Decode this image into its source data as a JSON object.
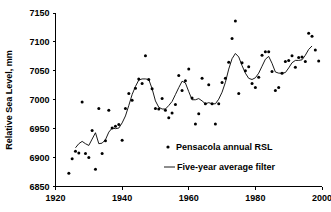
{
  "chart_data": {
    "type": "scatter",
    "title": "",
    "xlabel": "",
    "ylabel": "Relative Sea Level, mm",
    "xlim": [
      1920,
      2000
    ],
    "ylim": [
      6850,
      7150
    ],
    "xticks": [
      1920,
      1940,
      1960,
      1980,
      2000
    ],
    "yticks": [
      6850,
      6900,
      6950,
      7000,
      7050,
      7100,
      7150
    ],
    "grid": false,
    "legend_position": "center-right-inside",
    "series": [
      {
        "name": "Pensacola annual RSL",
        "marker": "dot",
        "color": "#000000",
        "x": [
          1924,
          1925,
          1926,
          1927,
          1928,
          1929,
          1930,
          1931,
          1932,
          1933,
          1934,
          1935,
          1936,
          1937,
          1938,
          1939,
          1940,
          1941,
          1942,
          1943,
          1944,
          1945,
          1946,
          1947,
          1948,
          1949,
          1950,
          1951,
          1952,
          1953,
          1954,
          1955,
          1956,
          1957,
          1958,
          1959,
          1960,
          1961,
          1962,
          1963,
          1964,
          1965,
          1966,
          1967,
          1968,
          1969,
          1970,
          1971,
          1972,
          1973,
          1974,
          1975,
          1976,
          1977,
          1978,
          1979,
          1980,
          1981,
          1982,
          1983,
          1984,
          1985,
          1986,
          1987,
          1988,
          1989,
          1990,
          1991,
          1992,
          1993,
          1994,
          1995,
          1996,
          1997,
          1998,
          1999
        ],
        "y": [
          6873,
          6898,
          6911,
          6908,
          6996,
          6907,
          6900,
          6947,
          6880,
          6985,
          6907,
          6929,
          6982,
          6951,
          6954,
          6957,
          6930,
          6985,
          7011,
          6999,
          7020,
          7036,
          7028,
          7076,
          7035,
          7019,
          6985,
          6984,
          7002,
          6982,
          6969,
          6977,
          6992,
          7042,
          7016,
          7033,
          7053,
          7003,
          6958,
          6976,
          7037,
          6993,
          7026,
          6993,
          6958,
          6993,
          7030,
          7037,
          7065,
          7106,
          7136,
          7011,
          7064,
          7050,
          7057,
          7028,
          7021,
          7039,
          7077,
          7083,
          7083,
          7049,
          7016,
          7021,
          7046,
          7066,
          7068,
          7076,
          7056,
          7073,
          7074,
          7066,
          7115,
          7110,
          7086,
          7067
        ]
      },
      {
        "name": "Five-year average filter",
        "marker": "line",
        "color": "#000000",
        "x": [
          1926,
          1927,
          1928,
          1929,
          1930,
          1931,
          1932,
          1933,
          1934,
          1935,
          1936,
          1937,
          1938,
          1939,
          1940,
          1941,
          1942,
          1943,
          1944,
          1945,
          1946,
          1947,
          1948,
          1949,
          1950,
          1951,
          1952,
          1953,
          1954,
          1955,
          1956,
          1957,
          1958,
          1959,
          1960,
          1961,
          1962,
          1963,
          1964,
          1965,
          1966,
          1967,
          1968,
          1969,
          1970,
          1971,
          1972,
          1973,
          1974,
          1975,
          1976,
          1977,
          1978,
          1979,
          1980,
          1981,
          1982,
          1983,
          1984,
          1985,
          1986,
          1987,
          1988,
          1989,
          1990,
          1991,
          1992,
          1993,
          1994,
          1995,
          1996,
          1997
        ],
        "y": [
          6917,
          6924,
          6928,
          6924,
          6921,
          6932,
          6943,
          6924,
          6925,
          6931,
          6944,
          6951,
          6950,
          6951,
          6960,
          6972,
          6990,
          7009,
          7023,
          7034,
          7036,
          7036,
          7035,
          7019,
          6998,
          6987,
          6984,
          6984,
          6990,
          6997,
          7009,
          7021,
          7032,
          7029,
          7014,
          7000,
          7000,
          7002,
          6998,
          6993,
          6995,
          6993,
          6993,
          7001,
          7013,
          7030,
          7053,
          7071,
          7080,
          7074,
          7059,
          7046,
          7037,
          7035,
          7038,
          7046,
          7058,
          7070,
          7075,
          7063,
          7048,
          7046,
          7046,
          7047,
          7055,
          7064,
          7068,
          7068,
          7069,
          7077,
          7087,
          7093
        ]
      }
    ]
  },
  "axis": {
    "y_title": "Relative Sea Level, mm",
    "y_tick_labels": [
      "7150",
      "7100",
      "7050",
      "7000",
      "6950",
      "6900",
      "6850"
    ],
    "x_tick_labels": [
      "1920",
      "1940",
      "1960",
      "1980",
      "2000"
    ]
  },
  "legend": {
    "entries": [
      {
        "label": "Pensacola annual RSL",
        "marker": "dot-marker"
      },
      {
        "label": "Five-year average filter",
        "marker": "line-marker"
      }
    ]
  }
}
